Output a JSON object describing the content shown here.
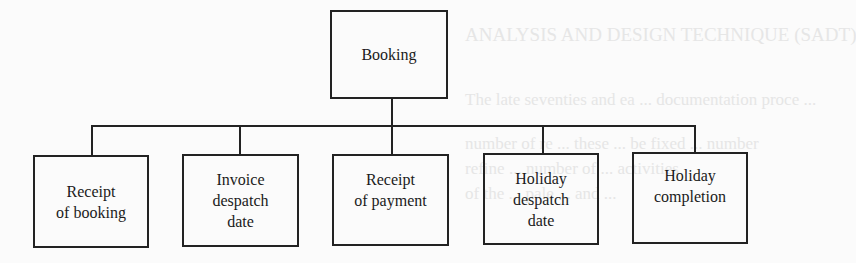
{
  "background_bleed": {
    "line1": "ANALYSIS AND DESIGN TECHNIQUE (SADT)",
    "line2": "The late seventies and ea  ... documentation proce  ...",
    "line3": "number of re  ... these  ... be fixed  ... number",
    "line4": "refine  ... number of  ... activities",
    "line5": "of the  ... pale  ... and ..."
  },
  "diagram": {
    "root": {
      "label": "Booking"
    },
    "children": [
      {
        "line1": "Receipt",
        "line2": "of booking",
        "line3": ""
      },
      {
        "line1": "Invoice",
        "line2": "despatch",
        "line3": "date"
      },
      {
        "line1": "Receipt",
        "line2": "of payment",
        "line3": ""
      },
      {
        "line1": "Holiday",
        "line2": "despatch",
        "line3": "date"
      },
      {
        "line1": "Holiday",
        "line2": "completion",
        "line3": ""
      }
    ]
  },
  "colors": {
    "line": "#222222",
    "background": "#fbfbfb",
    "bleed": "#e6e6e6"
  }
}
